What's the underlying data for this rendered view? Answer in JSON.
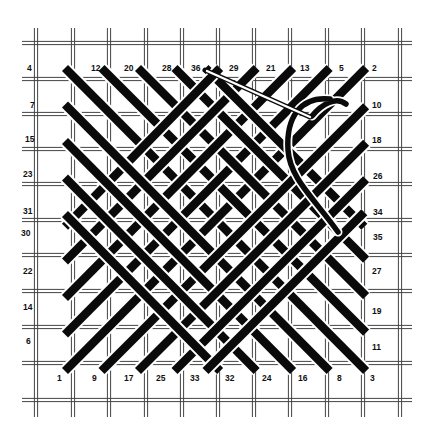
{
  "diagram": {
    "title": "",
    "type": "needlepoint-stitch-diagram",
    "colors": {
      "background": "#ffffff",
      "grid": "#444444",
      "stitch": "#0a0a0a",
      "outline": "#ffffff"
    },
    "grid": {
      "vertical_x": [
        36,
        73,
        109,
        146,
        182,
        218,
        254,
        290,
        327,
        363,
        400
      ],
      "horizontal_y": [
        43,
        79,
        114,
        149,
        184,
        220,
        255,
        291,
        327,
        363,
        400
      ],
      "x_extent": [
        22,
        412
      ],
      "y_extent": [
        28,
        417
      ]
    },
    "origin": [
      65,
      68
    ],
    "unit": 36.5,
    "stitches_down_right": [
      {
        "from": "4",
        "to": "3",
        "a": [
          0,
          0
        ],
        "b": [
          8.25,
          8.3
        ]
      },
      {
        "from": "12",
        "to": "11",
        "a": [
          1,
          0
        ],
        "b": [
          8.25,
          7.25
        ]
      },
      {
        "from": "20",
        "to": "19",
        "a": [
          2,
          0
        ],
        "b": [
          8.25,
          6.25
        ]
      },
      {
        "from": "28",
        "to": "27",
        "a": [
          3,
          0
        ],
        "b": [
          8.25,
          5.25
        ]
      },
      {
        "from": "36",
        "to": "35",
        "a": [
          3.85,
          0
        ],
        "b": [
          8.2,
          4.35
        ]
      },
      {
        "from": "7",
        "to": "8",
        "a": [
          0,
          1
        ],
        "b": [
          7.25,
          8.3
        ]
      },
      {
        "from": "15",
        "to": "16",
        "a": [
          0,
          2
        ],
        "b": [
          6.25,
          8.3
        ]
      },
      {
        "from": "23",
        "to": "24",
        "a": [
          0,
          3
        ],
        "b": [
          5.25,
          8.3
        ]
      },
      {
        "from": "31",
        "to": "32",
        "a": [
          0,
          4
        ],
        "b": [
          4.25,
          8.3
        ]
      }
    ],
    "stitches_up_right": [
      {
        "from": "1",
        "to": "2",
        "a": [
          0,
          8.3
        ],
        "b": [
          8.25,
          0
        ]
      },
      {
        "from": "6",
        "to": "5",
        "a": [
          0,
          7.3
        ],
        "b": [
          7.25,
          0
        ]
      },
      {
        "from": "14",
        "to": "13",
        "a": [
          0,
          6.3
        ],
        "b": [
          6.25,
          0
        ]
      },
      {
        "from": "22",
        "to": "21",
        "a": [
          0,
          5.3
        ],
        "b": [
          5.25,
          0
        ]
      },
      {
        "from": "30",
        "to": "29",
        "a": [
          0,
          4.35
        ],
        "b": [
          4.25,
          0
        ]
      },
      {
        "from": "9",
        "to": "10",
        "a": [
          1,
          8.3
        ],
        "b": [
          8.25,
          1.05
        ]
      },
      {
        "from": "17",
        "to": "18",
        "a": [
          2,
          8.3
        ],
        "b": [
          8.25,
          2.05
        ]
      },
      {
        "from": "25",
        "to": "26",
        "a": [
          3,
          8.3
        ],
        "b": [
          8.25,
          3.05
        ]
      },
      {
        "from": "33",
        "to": "34",
        "a": [
          3.85,
          8.3
        ],
        "b": [
          8.2,
          3.95
        ]
      }
    ],
    "labels": [
      {
        "text": "4",
        "x": 27,
        "y": 71
      },
      {
        "text": "12",
        "x": 91,
        "y": 71
      },
      {
        "text": "20",
        "x": 124,
        "y": 71
      },
      {
        "text": "28",
        "x": 162,
        "y": 71
      },
      {
        "text": "36",
        "x": 191,
        "y": 71
      },
      {
        "text": "29",
        "x": 229,
        "y": 71
      },
      {
        "text": "21",
        "x": 266,
        "y": 71
      },
      {
        "text": "13",
        "x": 300,
        "y": 71
      },
      {
        "text": "5",
        "x": 339,
        "y": 71
      },
      {
        "text": "2",
        "x": 372,
        "y": 71
      },
      {
        "text": "7",
        "x": 30,
        "y": 108
      },
      {
        "text": "15",
        "x": 25,
        "y": 142
      },
      {
        "text": "23",
        "x": 23,
        "y": 177
      },
      {
        "text": "31",
        "x": 23,
        "y": 214
      },
      {
        "text": "30",
        "x": 21,
        "y": 236
      },
      {
        "text": "22",
        "x": 23,
        "y": 274
      },
      {
        "text": "14",
        "x": 23,
        "y": 310
      },
      {
        "text": "6",
        "x": 26,
        "y": 344
      },
      {
        "text": "1",
        "x": 57,
        "y": 381
      },
      {
        "text": "9",
        "x": 92,
        "y": 381
      },
      {
        "text": "17",
        "x": 124,
        "y": 381
      },
      {
        "text": "25",
        "x": 156,
        "y": 381
      },
      {
        "text": "33",
        "x": 190,
        "y": 381
      },
      {
        "text": "32",
        "x": 225,
        "y": 381
      },
      {
        "text": "24",
        "x": 262,
        "y": 381
      },
      {
        "text": "16",
        "x": 298,
        "y": 381
      },
      {
        "text": "8",
        "x": 337,
        "y": 381
      },
      {
        "text": "3",
        "x": 370,
        "y": 381
      },
      {
        "text": "10",
        "x": 372,
        "y": 108
      },
      {
        "text": "18",
        "x": 372,
        "y": 143
      },
      {
        "text": "26",
        "x": 373,
        "y": 179
      },
      {
        "text": "34",
        "x": 373,
        "y": 215
      },
      {
        "text": "35",
        "x": 373,
        "y": 240
      },
      {
        "text": "27",
        "x": 372,
        "y": 274
      },
      {
        "text": "19",
        "x": 372,
        "y": 314
      },
      {
        "text": "11",
        "x": 372,
        "y": 350
      }
    ],
    "needle": {
      "tip": [
        205,
        70
      ],
      "eye": [
        310,
        117
      ]
    },
    "thread_path": "M 312 116 C 322 104, 336 96, 346 104 M 330 99 C 300 96, 286 118, 288 150 C 290 178, 312 196, 338 232"
  }
}
